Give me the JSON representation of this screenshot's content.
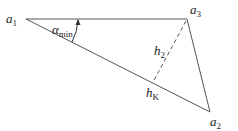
{
  "diagram": {
    "vertices": [
      {
        "id": "a1",
        "label": "a",
        "sub": "1"
      },
      {
        "id": "a2",
        "label": "a",
        "sub": "2"
      },
      {
        "id": "a3",
        "label": "a",
        "sub": "3"
      }
    ],
    "angle": {
      "label": "α",
      "sub": "min"
    },
    "height": {
      "label": "h",
      "sub": "2"
    },
    "foot": {
      "label": "h",
      "sub": "K"
    },
    "colors": {
      "stroke": "#555555",
      "text": "#222222"
    }
  }
}
